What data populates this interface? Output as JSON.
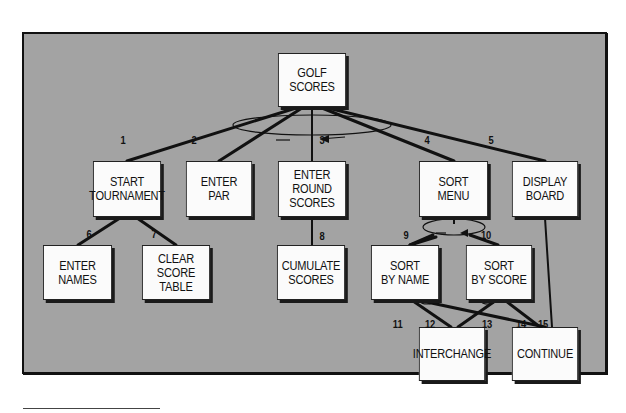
{
  "diagram": {
    "title": "GOLF SCORES",
    "colors": {
      "panel": "#a3a3a3",
      "box": "#fbfbfb",
      "line": "#111111"
    },
    "nodes": [
      {
        "id": "golf",
        "label": "GOLF\nSCORES",
        "x": 275,
        "y": 53,
        "w": 75,
        "h": 55
      },
      {
        "id": "start",
        "label": "START\nTOURNAMENT",
        "x": 90,
        "y": 161,
        "w": 75,
        "h": 57
      },
      {
        "id": "par",
        "label": "ENTER\nPAR",
        "x": 183,
        "y": 161,
        "w": 73,
        "h": 57
      },
      {
        "id": "round",
        "label": "ENTER\nROUND\nSCORES",
        "x": 275,
        "y": 161,
        "w": 75,
        "h": 57
      },
      {
        "id": "sortmenu",
        "label": "SORT\nMENU",
        "x": 416,
        "y": 161,
        "w": 76,
        "h": 57
      },
      {
        "id": "display",
        "label": "DISPLAY\nBOARD",
        "x": 509,
        "y": 161,
        "w": 73,
        "h": 57
      },
      {
        "id": "names",
        "label": "ENTER\nNAMES",
        "x": 40,
        "y": 245,
        "w": 76,
        "h": 56
      },
      {
        "id": "clear",
        "label": "CLEAR\nSCORE\nTABLE",
        "x": 139,
        "y": 245,
        "w": 75,
        "h": 56
      },
      {
        "id": "cumulate",
        "label": "CUMULATE\nSCORES",
        "x": 274,
        "y": 245,
        "w": 75,
        "h": 56
      },
      {
        "id": "byname",
        "label": "SORT\nBY NAME",
        "x": 368,
        "y": 245,
        "w": 75,
        "h": 56
      },
      {
        "id": "byscore",
        "label": "SORT\nBY SCORE",
        "x": 463,
        "y": 245,
        "w": 73,
        "h": 56
      },
      {
        "id": "interchange",
        "label": "INTERCHANGE",
        "x": 416,
        "y": 327,
        "w": 73,
        "h": 55
      },
      {
        "id": "continue",
        "label": "CONTINUE",
        "x": 509,
        "y": 327,
        "w": 73,
        "h": 55
      }
    ],
    "edges": [
      {
        "label": "1",
        "from": "golf",
        "to": "start"
      },
      {
        "label": "2",
        "from": "golf",
        "to": "par"
      },
      {
        "label": "3",
        "from": "golf",
        "to": "round"
      },
      {
        "label": "4",
        "from": "golf",
        "to": "sortmenu"
      },
      {
        "label": "5",
        "from": "golf",
        "to": "display"
      },
      {
        "label": "6",
        "from": "start",
        "to": "names"
      },
      {
        "label": "7",
        "from": "start",
        "to": "clear"
      },
      {
        "label": "8",
        "from": "round",
        "to": "cumulate"
      },
      {
        "label": "9",
        "from": "sortmenu",
        "to": "byname"
      },
      {
        "label": "10",
        "from": "sortmenu",
        "to": "byscore"
      },
      {
        "label": "11",
        "from": "byname",
        "to": "interchange"
      },
      {
        "label": "12",
        "from": "byscore",
        "to": "interchange"
      },
      {
        "label": "13",
        "from": "byname",
        "to": "continue"
      },
      {
        "label": "14",
        "from": "byscore",
        "to": "continue"
      },
      {
        "label": "15",
        "from": "display",
        "to": "continue"
      }
    ]
  }
}
